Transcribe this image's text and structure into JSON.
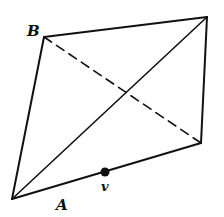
{
  "diagram": {
    "type": "quadrilateral-with-diagonals",
    "vertices": {
      "B": {
        "x": 44,
        "y": 37
      },
      "top_right": {
        "x": 207,
        "y": 17
      },
      "bottom_right": {
        "x": 201,
        "y": 143
      },
      "A": {
        "x": 12,
        "y": 199
      }
    },
    "edges": [
      {
        "from": "B",
        "to": "top_right",
        "style": "solid"
      },
      {
        "from": "top_right",
        "to": "bottom_right",
        "style": "solid"
      },
      {
        "from": "bottom_right",
        "to": "A",
        "style": "solid"
      },
      {
        "from": "A",
        "to": "B",
        "style": "solid"
      }
    ],
    "diagonals": [
      {
        "from": "A",
        "to": "top_right",
        "style": "solid"
      },
      {
        "from": "B",
        "to": "bottom_right",
        "style": "dashed"
      }
    ],
    "point": {
      "label": "v",
      "x": 105,
      "y": 172
    },
    "labels": {
      "B": "B",
      "A": "A",
      "v": "v"
    },
    "colors": {
      "stroke": "#111111",
      "background": "#ffffff"
    }
  }
}
